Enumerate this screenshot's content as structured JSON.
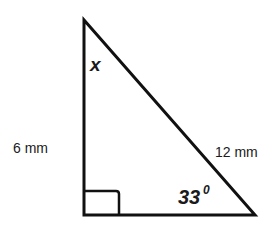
{
  "diagram": {
    "type": "right-triangle",
    "vertices": {
      "top": {
        "x": 84,
        "y": 20
      },
      "bottom_left": {
        "x": 84,
        "y": 215
      },
      "bottom_right": {
        "x": 255,
        "y": 215
      }
    },
    "right_angle_marker": {
      "x": 84,
      "y": 191,
      "size": 35
    },
    "labels": {
      "vertical_side": "6 mm",
      "hypotenuse": "12 mm",
      "unknown_angle": "x",
      "known_angle_value": "33",
      "known_angle_unit": "0"
    },
    "colors": {
      "stroke": "#111111",
      "background": "#ffffff"
    }
  }
}
